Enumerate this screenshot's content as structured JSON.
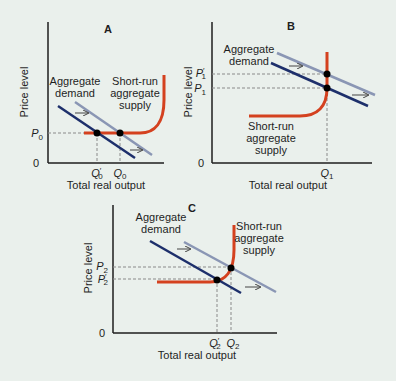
{
  "colors": {
    "background": "#eaf0ec",
    "axis": "#1e1e1e",
    "aggregate_demand_new": "#1d2f6b",
    "aggregate_demand_old": "#8a96b4",
    "short_run_aggregate_supply": "#d4411f",
    "guide_line": "#8a8a8a",
    "equilibrium_point": "#000000"
  },
  "panels": [
    {
      "id": "A",
      "title": "A",
      "y_axis_label": "Price level",
      "x_axis_label": "Total real output",
      "origin_label": "0",
      "ad_label_line1": "Aggregate",
      "ad_label_line2": "demand",
      "sras_label_line1": "Short-run",
      "sras_label_line2": "aggregate",
      "sras_label_line3": "supply",
      "price_ticks": [
        {
          "base": "P",
          "prime": "",
          "sub": "0"
        }
      ],
      "output_ticks": [
        {
          "base": "Q",
          "prime": "′",
          "sub": "0"
        },
        {
          "base": "Q",
          "prime": "",
          "sub": "0"
        }
      ],
      "description": "AD shifts left along flat portion of SRAS: output falls from Q0 to Q'0, price level stays at P0"
    },
    {
      "id": "B",
      "title": "B",
      "y_axis_label": "Price level",
      "x_axis_label": "Total real output",
      "origin_label": "0",
      "ad_label_line1": "Aggregate",
      "ad_label_line2": "demand",
      "sras_label_line1": "Short-run",
      "sras_label_line2": "aggregate",
      "sras_label_line3": "supply",
      "price_ticks": [
        {
          "base": "P",
          "prime": "′",
          "sub": "1"
        },
        {
          "base": "P",
          "prime": "",
          "sub": "1"
        }
      ],
      "output_ticks": [
        {
          "base": "Q",
          "prime": "",
          "sub": "1"
        }
      ],
      "description": "AD shifts left along vertical portion of SRAS: price falls from P'1 to P1, output stays at Q1"
    },
    {
      "id": "C",
      "title": "C",
      "y_axis_label": "Price level",
      "x_axis_label": "Total real output",
      "origin_label": "0",
      "ad_label_line1": "Aggregate",
      "ad_label_line2": "demand",
      "sras_label_line1": "Short-run",
      "sras_label_line2": "aggregate",
      "sras_label_line3": "supply",
      "price_ticks": [
        {
          "base": "P",
          "prime": "",
          "sub": "2"
        },
        {
          "base": "P",
          "prime": "′",
          "sub": "2"
        }
      ],
      "output_ticks": [
        {
          "base": "Q",
          "prime": "′",
          "sub": "2"
        },
        {
          "base": "Q",
          "prime": "",
          "sub": "2"
        }
      ],
      "description": "AD shifts left along curved portion of SRAS: price falls from P2 to P'2 and output falls from Q2 to Q'2"
    }
  ]
}
